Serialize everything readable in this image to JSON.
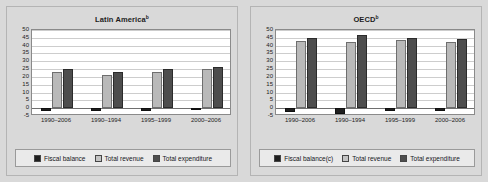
{
  "page": {
    "background_color": "#d9d9d9",
    "plot_background_color": "#ffffff"
  },
  "colors": {
    "fiscal_balance": "#1f1f1f",
    "total_revenue": "#b9b9b9",
    "total_expenditure": "#4d4d4d",
    "gridline": "#cdcdcd",
    "axis": "#8a8a8a",
    "legend_background": "#eaeaea"
  },
  "panels": [
    {
      "title": "Latin America",
      "title_superscript": "b",
      "legend": [
        {
          "label": "Fiscal balance",
          "key": "balance"
        },
        {
          "label": "Total revenue",
          "key": "revenue"
        },
        {
          "label": "Total expenditure",
          "key": "expend"
        }
      ]
    },
    {
      "title": "OECD",
      "title_superscript": "b",
      "legend": [
        {
          "label": "Fiscal balance(c)",
          "key": "balance"
        },
        {
          "label": "Total revenue",
          "key": "revenue"
        },
        {
          "label": "Total expenditure",
          "key": "expend"
        }
      ]
    }
  ],
  "chart_data": [
    {
      "type": "bar",
      "title": "Latin America",
      "title_superscript": "b",
      "xlabel": "",
      "ylabel": "",
      "ylim": [
        -5,
        50
      ],
      "yticks": [
        50,
        45,
        40,
        35,
        30,
        25,
        20,
        15,
        10,
        5,
        0,
        -5
      ],
      "grid": true,
      "legend_position": "bottom",
      "categories": [
        "1990–2006",
        "1990–1994",
        "1995–1999",
        "2000–2006"
      ],
      "series": [
        {
          "name": "Fiscal balance",
          "values": [
            -1.5,
            -2.0,
            -2.0,
            -1.3
          ]
        },
        {
          "name": "Total revenue",
          "values": [
            23.0,
            21.0,
            23.0,
            25.0
          ]
        },
        {
          "name": "Total expenditure",
          "values": [
            25.0,
            23.2,
            25.0,
            26.2
          ]
        }
      ]
    },
    {
      "type": "bar",
      "title": "OECD",
      "title_superscript": "b",
      "xlabel": "",
      "ylabel": "",
      "ylim": [
        -5,
        50
      ],
      "yticks": [
        50,
        45,
        40,
        35,
        30,
        25,
        20,
        15,
        10,
        5,
        0,
        -5
      ],
      "grid": true,
      "legend_position": "bottom",
      "categories": [
        "1990–2006",
        "1990–1994",
        "1995–1999",
        "2000–2006"
      ],
      "series": [
        {
          "name": "Fiscal balance(c)",
          "values": [
            -2.5,
            -4.0,
            -1.8,
            -1.5
          ]
        },
        {
          "name": "Total revenue",
          "values": [
            43.0,
            42.5,
            43.5,
            42.5
          ]
        },
        {
          "name": "Total expenditure",
          "values": [
            45.0,
            46.5,
            45.2,
            44.0
          ]
        }
      ]
    }
  ]
}
